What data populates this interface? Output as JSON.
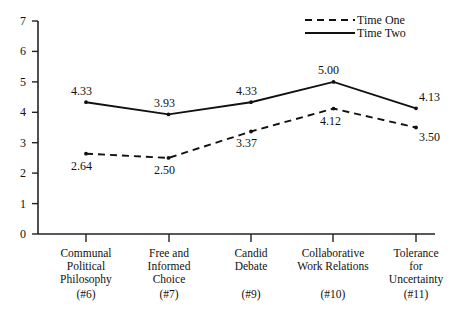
{
  "chart_data": {
    "type": "line",
    "title": "",
    "xlabel": "",
    "ylabel": "",
    "ylim": [
      0,
      7
    ],
    "yticks": [
      "0",
      "1",
      "2",
      "3",
      "4",
      "5",
      "6",
      "7"
    ],
    "grid": false,
    "legend_position": "top-right",
    "categories": [
      "Communal Political Philosophy",
      "Free and Informed Choice",
      "Candid Debate",
      "Collaborative Work Relations",
      "Tolerance for Uncertainty"
    ],
    "category_lines": [
      [
        "Communal",
        "Political",
        "Philosophy"
      ],
      [
        "Free and",
        "Informed",
        "Choice"
      ],
      [
        "Candid",
        "Debate"
      ],
      [
        "Collaborative",
        "Work Relations"
      ],
      [
        "Tolerance",
        "for",
        "Uncertainty"
      ]
    ],
    "category_numbers": [
      "(#6)",
      "(#7)",
      "(#9)",
      "(#10)",
      "(#11)"
    ],
    "series": [
      {
        "name": "Time One",
        "style": "dashed",
        "values": [
          2.64,
          2.5,
          3.37,
          4.12,
          3.5
        ],
        "labels": [
          "2.64",
          "2.50",
          "3.37",
          "4.12",
          "3.50"
        ]
      },
      {
        "name": "Time Two",
        "style": "solid",
        "values": [
          4.33,
          3.93,
          4.33,
          5.0,
          4.13
        ],
        "labels": [
          "4.33",
          "3.93",
          "4.33",
          "5.00",
          "4.13"
        ]
      }
    ]
  },
  "legend": {
    "entries": [
      {
        "label": "Time One",
        "style": "dashed"
      },
      {
        "label": "Time Two",
        "style": "solid"
      }
    ]
  },
  "colors": {
    "line": "#111111",
    "axis": "#222222",
    "background": "#ffffff"
  }
}
